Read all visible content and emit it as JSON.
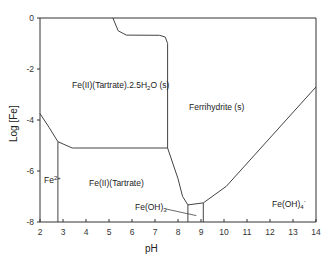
{
  "chart_data": {
    "type": "line",
    "title": "",
    "xlabel": "pH",
    "ylabel": "Log [Fe]",
    "xlim": [
      2,
      14
    ],
    "ylim": [
      -8,
      0
    ],
    "xticks": [
      2,
      3,
      4,
      5,
      6,
      7,
      8,
      9,
      10,
      11,
      12,
      13,
      14
    ],
    "yticks": [
      0,
      -2,
      -4,
      -6,
      -8
    ],
    "grid": false,
    "legend": null,
    "boundaries": [
      {
        "name": "Fe(II)(Tartrate).2.5H2O upper boundary",
        "points": [
          [
            5.17,
            0
          ],
          [
            5.4,
            -0.5
          ],
          [
            5.75,
            -0.67
          ],
          [
            7.2,
            -0.68
          ],
          [
            7.45,
            -0.75
          ],
          [
            7.55,
            -1.0
          ],
          [
            7.55,
            -5.1
          ]
        ]
      },
      {
        "name": "Fe2+ / Fe(II)(Tartrate).2.5H2O boundary",
        "points": [
          [
            2.0,
            -3.75
          ],
          [
            2.4,
            -4.3
          ],
          [
            2.78,
            -4.85
          ],
          [
            3.4,
            -5.1
          ],
          [
            7.55,
            -5.1
          ]
        ]
      },
      {
        "name": "Fe2+ / Fe(II)(Tartrate) boundary",
        "points": [
          [
            2.78,
            -4.85
          ],
          [
            2.78,
            -8.0
          ]
        ]
      },
      {
        "name": "Ferrihydrite lower boundary",
        "points": [
          [
            7.55,
            -5.1
          ],
          [
            8.0,
            -6.3
          ],
          [
            8.2,
            -7.0
          ],
          [
            8.43,
            -7.33
          ],
          [
            9.1,
            -7.25
          ],
          [
            10.1,
            -6.6
          ],
          [
            14.0,
            -2.7
          ]
        ]
      },
      {
        "name": "Fe(OH)3 box left",
        "points": [
          [
            8.43,
            -7.33
          ],
          [
            8.43,
            -8.0
          ]
        ]
      },
      {
        "name": "Fe(OH)3 box right",
        "points": [
          [
            9.1,
            -7.25
          ],
          [
            9.1,
            -8.0
          ]
        ]
      }
    ],
    "annotations": [
      {
        "text": "Fe(II)(Tartrate).2.5H2O (s)",
        "x": 4.1,
        "y": -2.7
      },
      {
        "text": "Ferrihydrite (s)",
        "x": 8.6,
        "y": -3.6
      },
      {
        "text": "Fe2+",
        "x": 2.2,
        "y": -6.1
      },
      {
        "text": "Fe(II)(Tartrate)",
        "x": 4.0,
        "y": -6.3
      },
      {
        "text": "Fe(OH)3",
        "x": 7.1,
        "y": -7.2,
        "arrow_to": [
          8.8,
          -7.75
        ]
      },
      {
        "text": "Fe(OH)4-",
        "x": 12.0,
        "y": -7.3
      }
    ]
  },
  "labels": {
    "xlabel": "pH",
    "ylabel": "Log [Fe]",
    "region_tartrate_solid": "Fe(II)(Tartrate).2.5H",
    "region_tartrate_solid_sub": "2",
    "region_tartrate_solid_tail": "O (s)",
    "region_ferrihydrite": "Ferrihydrite (s)",
    "region_fe2": "Fe",
    "region_fe2_sup": "2+",
    "region_tartrate": "Fe(II)(Tartrate)",
    "region_feoh3": "Fe(OH)",
    "region_feoh3_sub": "3",
    "region_feoh4": "Fe(OH)",
    "region_feoh4_sub": "4",
    "region_feoh4_sup": "-"
  },
  "colors": {
    "line": "#444444",
    "axis": "#333333",
    "text": "#222222"
  }
}
